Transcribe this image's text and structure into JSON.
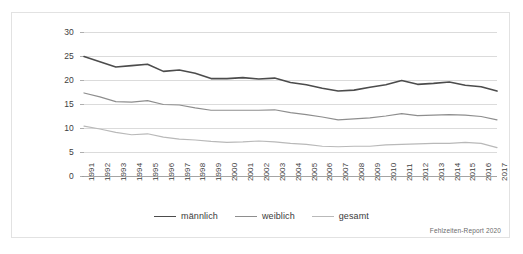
{
  "chart_data": {
    "type": "line",
    "title": "",
    "subtitle": "",
    "xlabel": "",
    "ylabel": "",
    "xlim": [
      1991,
      2017
    ],
    "ylim": [
      0,
      30
    ],
    "yticks": [
      0,
      5,
      10,
      15,
      20,
      25,
      30
    ],
    "grid": true,
    "legend_position": "bottom",
    "categories": [
      "1991",
      "1992",
      "1993",
      "1994",
      "1995",
      "1996",
      "1997",
      "1998",
      "1999",
      "2000",
      "2001",
      "2002",
      "2003",
      "2004",
      "2005",
      "2006",
      "2007",
      "2008",
      "2009",
      "2010",
      "2011",
      "2012",
      "2013",
      "2014",
      "2015",
      "2016",
      "2017"
    ],
    "series": [
      {
        "name": "männlich",
        "color": "#4c4c4c",
        "width": 1.6,
        "values": [
          25.0,
          23.9,
          22.8,
          23.1,
          23.4,
          21.9,
          22.2,
          21.5,
          20.4,
          20.4,
          20.6,
          20.3,
          20.5,
          19.6,
          19.1,
          18.4,
          17.8,
          18.0,
          18.6,
          19.1,
          20.0,
          19.2,
          19.4,
          19.7,
          19.0,
          18.7,
          17.8
        ]
      },
      {
        "name": "weiblich",
        "color": "#8e8e8e",
        "width": 1.2,
        "values": [
          17.4,
          16.6,
          15.6,
          15.5,
          15.8,
          15.0,
          14.9,
          14.3,
          13.8,
          13.8,
          13.8,
          13.8,
          13.9,
          13.3,
          12.9,
          12.4,
          11.8,
          12.0,
          12.2,
          12.6,
          13.1,
          12.7,
          12.8,
          12.9,
          12.8,
          12.5,
          11.8
        ]
      },
      {
        "name": "gesamt",
        "color": "#b9b9b9",
        "width": 1.2,
        "values": [
          10.5,
          9.9,
          9.2,
          8.7,
          8.9,
          8.2,
          7.8,
          7.6,
          7.3,
          7.1,
          7.2,
          7.4,
          7.2,
          6.9,
          6.7,
          6.3,
          6.2,
          6.3,
          6.3,
          6.6,
          6.7,
          6.8,
          6.9,
          6.9,
          7.1,
          6.9,
          6.0
        ]
      }
    ],
    "source_note": "Fehlzeiten-Report 2020"
  },
  "colors": {
    "maennlich": "#4c4c4c",
    "weiblich": "#8e8e8e",
    "gesamt": "#b9b9b9",
    "grid": "#d2d2d2",
    "axis": "#9a9a9a",
    "frame": "#e2e2e2",
    "text": "#3d3d3d"
  }
}
